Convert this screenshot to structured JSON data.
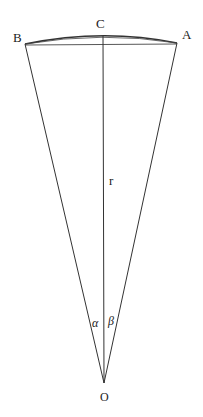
{
  "diagram": {
    "type": "geometry-sector",
    "labels": {
      "A": "A",
      "B": "B",
      "C": "C",
      "O": "O",
      "r": "r",
      "alpha": "α",
      "beta": "β"
    },
    "points": {
      "A": [
        177,
        43
      ],
      "B": [
        25,
        44
      ],
      "C": [
        103,
        36
      ],
      "O": [
        104,
        383
      ]
    },
    "colors": {
      "line": "#333333",
      "text": "#222222",
      "background": "#ffffff"
    }
  }
}
